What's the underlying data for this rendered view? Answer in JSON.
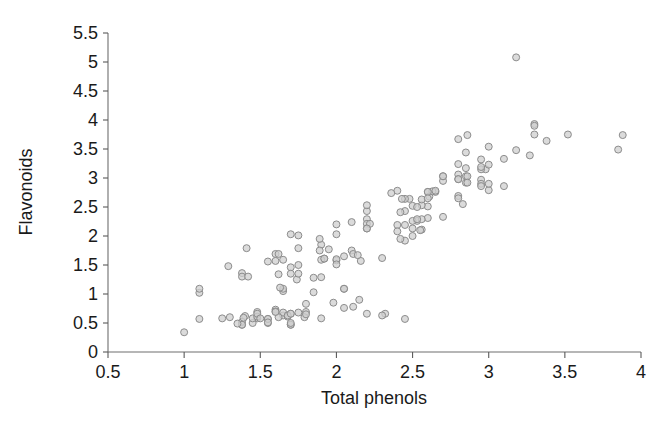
{
  "chart_data": {
    "type": "scatter",
    "title": "",
    "xlabel": "Total phenols",
    "ylabel": "Flavonoids",
    "xlim": [
      0.5,
      4.0
    ],
    "ylim": [
      0.0,
      5.5
    ],
    "xticks": [
      "0.5",
      "1",
      "1.5",
      "2",
      "2.5",
      "3",
      "3.5",
      "4"
    ],
    "xtick_values": [
      0.5,
      1,
      1.5,
      2,
      2.5,
      3,
      3.5,
      4
    ],
    "yticks": [
      "0",
      "0.5",
      "1",
      "1.5",
      "2",
      "2.5",
      "3",
      "3.5",
      "4",
      "4.5",
      "5",
      "5.5"
    ],
    "ytick_values": [
      0,
      0.5,
      1,
      1.5,
      2,
      2.5,
      3,
      3.5,
      4,
      4.5,
      5,
      5.5
    ],
    "grid": false,
    "legend": null,
    "marker": {
      "shape": "circle",
      "size": 7,
      "fill_color": "#cfcfcf",
      "edge_color": "#8c8c8c"
    },
    "n_points": 178,
    "points": [
      [
        2.8,
        3.06
      ],
      [
        2.65,
        2.76
      ],
      [
        2.8,
        3.24
      ],
      [
        3.85,
        3.49
      ],
      [
        2.8,
        2.69
      ],
      [
        3.27,
        3.39
      ],
      [
        2.5,
        2.52
      ],
      [
        2.6,
        2.51
      ],
      [
        2.8,
        2.98
      ],
      [
        2.98,
        3.15
      ],
      [
        2.95,
        3.32
      ],
      [
        2.2,
        2.43
      ],
      [
        2.6,
        2.76
      ],
      [
        2.85,
        3.44
      ],
      [
        3.0,
        3.54
      ],
      [
        2.95,
        3.15
      ],
      [
        3.3,
        3.93
      ],
      [
        2.85,
        3.03
      ],
      [
        3.38,
        3.64
      ],
      [
        2.4,
        2.19
      ],
      [
        2.95,
        2.97
      ],
      [
        2.7,
        2.33
      ],
      [
        2.2,
        2.29
      ],
      [
        2.53,
        2.26
      ],
      [
        2.56,
        2.53
      ],
      [
        2.45,
        1.92
      ],
      [
        2.61,
        2.68
      ],
      [
        2.48,
        2.64
      ],
      [
        2.53,
        2.5
      ],
      [
        2.56,
        2.63
      ],
      [
        2.5,
        2.26
      ],
      [
        2.63,
        2.77
      ],
      [
        2.86,
        3.74
      ],
      [
        3.0,
        2.79
      ],
      [
        3.0,
        2.9
      ],
      [
        2.4,
        2.78
      ],
      [
        2.95,
        2.9
      ],
      [
        2.65,
        2.78
      ],
      [
        2.8,
        2.98
      ],
      [
        2.45,
        2.43
      ],
      [
        2.6,
        2.76
      ],
      [
        2.42,
        2.41
      ],
      [
        2.6,
        2.31
      ],
      [
        3.18,
        5.08
      ],
      [
        2.8,
        2.65
      ],
      [
        3.1,
        3.33
      ],
      [
        2.7,
        2.95
      ],
      [
        3.52,
        3.75
      ],
      [
        3.3,
        3.9
      ],
      [
        2.85,
        3.17
      ],
      [
        2.95,
        3.19
      ],
      [
        3.18,
        3.48
      ],
      [
        3.3,
        3.75
      ],
      [
        2.85,
        2.92
      ],
      [
        3.0,
        3.23
      ],
      [
        2.8,
        3.67
      ],
      [
        2.45,
        2.64
      ],
      [
        2.5,
        2.0
      ],
      [
        2.6,
        2.65
      ],
      [
        3.1,
        2.86
      ],
      [
        3.88,
        3.74
      ],
      [
        2.7,
        3.03
      ],
      [
        2.56,
        2.29
      ],
      [
        2.4,
        2.08
      ],
      [
        2.1,
        1.75
      ],
      [
        1.1,
        0.57
      ],
      [
        1.9,
        1.85
      ],
      [
        2.83,
        2.55
      ],
      [
        2.2,
        2.21
      ],
      [
        2.45,
        2.19
      ],
      [
        2.2,
        2.53
      ],
      [
        1.6,
        1.69
      ],
      [
        2.36,
        2.74
      ],
      [
        2.0,
        2.03
      ],
      [
        2.56,
        2.11
      ],
      [
        1.7,
        2.03
      ],
      [
        2.0,
        1.58
      ],
      [
        1.1,
        1.02
      ],
      [
        2.2,
        2.13
      ],
      [
        2.7,
        3.03
      ],
      [
        2.05,
        1.09
      ],
      [
        2.95,
        2.86
      ],
      [
        1.38,
        1.36
      ],
      [
        1.89,
        1.75
      ],
      [
        1.95,
        1.77
      ],
      [
        1.75,
        1.79
      ],
      [
        1.85,
        1.03
      ],
      [
        2.1,
        2.24
      ],
      [
        1.89,
        1.95
      ],
      [
        2.0,
        1.6
      ],
      [
        1.74,
        1.25
      ],
      [
        1.41,
        1.79
      ],
      [
        1.85,
        1.28
      ],
      [
        1.8,
        0.83
      ],
      [
        2.05,
        1.09
      ],
      [
        1.65,
        1.05
      ],
      [
        2.55,
        2.1
      ],
      [
        1.98,
        0.85
      ],
      [
        1.65,
        1.09
      ],
      [
        1.92,
        1.61
      ],
      [
        2.11,
        1.69
      ],
      [
        2.53,
        2.29
      ],
      [
        1.6,
        1.57
      ],
      [
        1.75,
        1.5
      ],
      [
        1.63,
        1.11
      ],
      [
        2.22,
        2.21
      ],
      [
        2.42,
        1.95
      ],
      [
        1.75,
        2.01
      ],
      [
        1.62,
        1.69
      ],
      [
        2.05,
        1.65
      ],
      [
        2.0,
        2.2
      ],
      [
        1.1,
        1.09
      ],
      [
        1.38,
        1.3
      ],
      [
        1.55,
        1.56
      ],
      [
        1.42,
        1.3
      ],
      [
        1.7,
        1.46
      ],
      [
        2.3,
        1.62
      ],
      [
        2.43,
        2.64
      ],
      [
        2.86,
        3.03
      ],
      [
        1.75,
        1.35
      ],
      [
        2.16,
        1.57
      ],
      [
        1.29,
        1.48
      ],
      [
        2.2,
        2.13
      ],
      [
        1.65,
        1.59
      ],
      [
        1.9,
        1.29
      ],
      [
        2.0,
        1.51
      ],
      [
        1.9,
        1.59
      ],
      [
        2.5,
        2.13
      ],
      [
        2.14,
        1.67
      ],
      [
        2.86,
        2.92
      ],
      [
        1.62,
        1.34
      ],
      [
        1.92,
        1.61
      ],
      [
        1.7,
        1.35
      ],
      [
        1.65,
        0.63
      ],
      [
        2.32,
        0.66
      ],
      [
        2.45,
        0.57
      ],
      [
        2.11,
        0.78
      ],
      [
        1.48,
        0.58
      ],
      [
        1.38,
        0.47
      ],
      [
        1.65,
        0.68
      ],
      [
        1.9,
        0.58
      ],
      [
        1.7,
        0.47
      ],
      [
        1.8,
        0.69
      ],
      [
        1.45,
        0.5
      ],
      [
        1.55,
        0.5
      ],
      [
        1.62,
        0.6
      ],
      [
        1.7,
        0.66
      ],
      [
        1.68,
        0.61
      ],
      [
        1.4,
        0.62
      ],
      [
        1.55,
        0.57
      ],
      [
        1.79,
        0.6
      ],
      [
        1.48,
        0.69
      ],
      [
        1.6,
        0.73
      ],
      [
        1.38,
        0.52
      ],
      [
        1.39,
        0.59
      ],
      [
        1.7,
        0.47
      ],
      [
        1.8,
        0.65
      ],
      [
        1.68,
        0.63
      ],
      [
        2.15,
        0.9
      ],
      [
        1.55,
        0.57
      ],
      [
        1.45,
        0.58
      ],
      [
        1.38,
        0.47
      ],
      [
        1.6,
        0.7
      ],
      [
        1.7,
        0.66
      ],
      [
        1.48,
        0.61
      ],
      [
        1.25,
        0.58
      ],
      [
        1.6,
        0.69
      ],
      [
        1.75,
        0.68
      ],
      [
        1.7,
        0.5
      ],
      [
        1.3,
        0.6
      ],
      [
        1.35,
        0.49
      ],
      [
        1.48,
        0.66
      ],
      [
        1.55,
        0.51
      ],
      [
        2.2,
        0.66
      ],
      [
        1.5,
        0.58
      ],
      [
        1.0,
        0.34
      ],
      [
        2.3,
        0.63
      ],
      [
        2.05,
        0.76
      ]
    ]
  },
  "axis": {
    "y_title": "Flavonoids",
    "x_title": "Total phenols"
  }
}
